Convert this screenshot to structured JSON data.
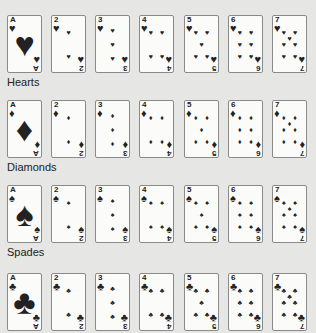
{
  "suits": [
    {
      "name": "Hearts",
      "glyph": "♥",
      "label_top": 76
    },
    {
      "name": "Diamonds",
      "glyph": "♦",
      "label_top": 161
    },
    {
      "name": "Spades",
      "glyph": "♠",
      "label_top": 246
    },
    {
      "name": "Clubs",
      "glyph": "♣",
      "label_top": null
    }
  ],
  "ranks": [
    "A",
    "2",
    "3",
    "4",
    "5",
    "6",
    "7"
  ],
  "row_tops": [
    15,
    100,
    185,
    273
  ],
  "card_lefts": [
    0,
    44,
    88,
    132,
    177,
    221,
    265
  ]
}
